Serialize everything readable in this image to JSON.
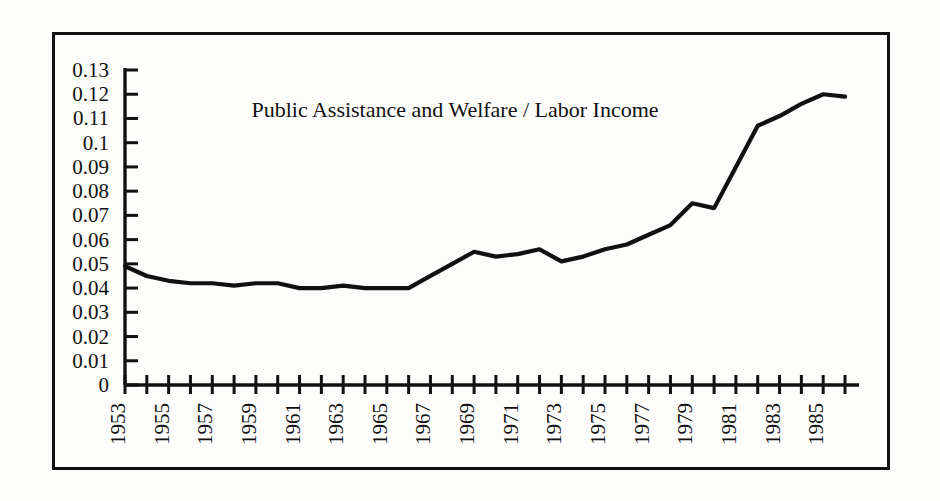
{
  "chart_data": {
    "type": "line",
    "title": "Public Assistance and Welfare / Labor Income",
    "xlabel": "",
    "ylabel": "",
    "grid": false,
    "legend": null,
    "ylim": [
      0,
      0.13
    ],
    "xlim": [
      1953,
      1986
    ],
    "ytick_labels": [
      "0.13",
      "0.12",
      "0.11",
      "0.1",
      "0.09",
      "0.08",
      "0.07",
      "0.06",
      "0.05",
      "0.04",
      "0.03",
      "0.02",
      "0.01",
      "0"
    ],
    "ytick_values": [
      0.13,
      0.12,
      0.11,
      0.1,
      0.09,
      0.08,
      0.07,
      0.06,
      0.05,
      0.04,
      0.03,
      0.02,
      0.01,
      0
    ],
    "xtick_labels": [
      "1953",
      "1955",
      "1957",
      "1959",
      "1961",
      "1963",
      "1965",
      "1967",
      "1969",
      "1971",
      "1973",
      "1975",
      "1977",
      "1979",
      "1981",
      "1983",
      "1985"
    ],
    "xtick_label_rotation": -90,
    "x": [
      1953,
      1954,
      1955,
      1956,
      1957,
      1958,
      1959,
      1960,
      1961,
      1962,
      1963,
      1964,
      1965,
      1966,
      1967,
      1968,
      1969,
      1970,
      1971,
      1972,
      1973,
      1974,
      1975,
      1976,
      1977,
      1978,
      1979,
      1980,
      1981,
      1982,
      1983,
      1984,
      1985,
      1986
    ],
    "values": [
      0.049,
      0.045,
      0.043,
      0.042,
      0.042,
      0.041,
      0.042,
      0.042,
      0.04,
      0.04,
      0.041,
      0.04,
      0.04,
      0.04,
      0.045,
      0.05,
      0.055,
      0.053,
      0.054,
      0.056,
      0.051,
      0.053,
      0.056,
      0.058,
      0.062,
      0.066,
      0.075,
      0.073,
      0.09,
      0.107,
      0.111,
      0.116,
      0.12,
      0.119
    ],
    "line_color": "#111111",
    "background_color": "#fdfdfc"
  },
  "figure": {
    "border_color": "#111111",
    "title_text": "Public Assistance and Welfare / Labor Income"
  }
}
